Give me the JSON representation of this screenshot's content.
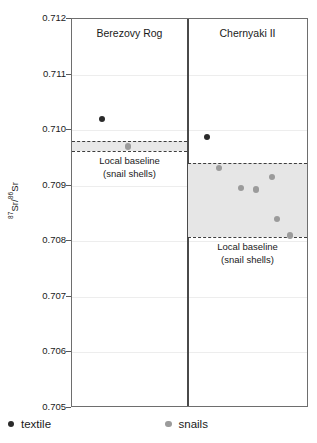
{
  "chart_data": {
    "type": "scatter",
    "title": "",
    "xlabel": "",
    "ylabel": "87Sr/86Sr",
    "ylabel_numerator": "87",
    "ylabel_denominator": "86",
    "ylabel_element_a": "Sr/",
    "ylabel_element_b": "Sr",
    "ylim": [
      0.705,
      0.712
    ],
    "yticks": [
      "0.712",
      "0.711",
      "0.710",
      "0.709",
      "0.708",
      "0.707",
      "0.706",
      "0.705"
    ],
    "ytick_values": [
      0.712,
      0.711,
      0.71,
      0.709,
      0.708,
      0.707,
      0.706,
      0.705
    ],
    "grid": true,
    "legend_position": "bottom",
    "legend": [
      {
        "name": "textile",
        "color": "#2b2b2b",
        "marker": "circle"
      },
      {
        "name": "snails",
        "color": "#9b9b9b",
        "marker": "circle"
      }
    ],
    "panels": [
      {
        "name": "Berezovy Rog",
        "baseline": {
          "label_line1": "Local baseline",
          "label_line2": "(snail shells)",
          "min": 0.70962,
          "max": 0.7098,
          "fill": "#e8e8e8",
          "edge_color": "#3d3d3d"
        },
        "series": [
          {
            "name": "textile",
            "color": "#2b2b2b",
            "values": [
              0.7102
            ]
          },
          {
            "name": "snails",
            "color": "#9b9b9b",
            "values": [
              0.70971
            ]
          }
        ]
      },
      {
        "name": "Chernyaki II",
        "baseline": {
          "label_line1": "Local baseline",
          "label_line2": "(snail shells)",
          "min": 0.70808,
          "max": 0.70941,
          "fill": "#e6e6e6",
          "edge_color": "#3d3d3d"
        },
        "series": [
          {
            "name": "textile",
            "color": "#2b2b2b",
            "values": [
              0.70988
            ]
          },
          {
            "name": "snails",
            "color": "#9b9b9b",
            "values": [
              0.70932,
              0.70916,
              0.70896,
              0.70893,
              0.7084,
              0.7081
            ]
          }
        ]
      }
    ]
  },
  "legend": {
    "textile_label": "textile",
    "snails_label": "snails"
  },
  "axis": {
    "y_title_sup1": "87",
    "y_title_mid": "Sr/",
    "y_title_sup2": "86",
    "y_title_end": "Sr"
  }
}
